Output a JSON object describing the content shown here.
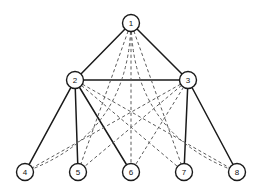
{
  "figure": {
    "background_color": "#ffffff",
    "solid_edge_color": "#1a1a1a",
    "dashed_edge_color": "#5a5a5a",
    "node_fill_color": "#ffffff",
    "node_stroke_color": "#1a1a1a"
  },
  "chart_data": {
    "type": "diagram",
    "subtype": "node-link-graph",
    "title": "",
    "xlabel": "",
    "ylabel": "",
    "grid": false,
    "legend": [],
    "node_radius": 8.5,
    "nodes": [
      {
        "id": "1",
        "label": "1",
        "x": 131,
        "y": 23
      },
      {
        "id": "2",
        "label": "2",
        "x": 75,
        "y": 80
      },
      {
        "id": "3",
        "label": "3",
        "x": 188,
        "y": 80
      },
      {
        "id": "4",
        "label": "4",
        "x": 25,
        "y": 172
      },
      {
        "id": "5",
        "label": "5",
        "x": 78,
        "y": 172
      },
      {
        "id": "6",
        "label": "6",
        "x": 131,
        "y": 172
      },
      {
        "id": "7",
        "label": "7",
        "x": 184,
        "y": 172
      },
      {
        "id": "8",
        "label": "8",
        "x": 237,
        "y": 172
      }
    ],
    "edges": [
      {
        "from": "1",
        "to": "2",
        "style": "solid",
        "shape": "line"
      },
      {
        "from": "1",
        "to": "3",
        "style": "solid",
        "shape": "line"
      },
      {
        "from": "2",
        "to": "3",
        "style": "solid",
        "shape": "line"
      },
      {
        "from": "2",
        "to": "4",
        "style": "solid",
        "shape": "line"
      },
      {
        "from": "2",
        "to": "5",
        "style": "solid",
        "shape": "line"
      },
      {
        "from": "2",
        "to": "6",
        "style": "solid",
        "shape": "line"
      },
      {
        "from": "3",
        "to": "6",
        "style": "dashed",
        "shape": "line"
      },
      {
        "from": "3",
        "to": "7",
        "style": "solid",
        "shape": "line"
      },
      {
        "from": "3",
        "to": "8",
        "style": "solid",
        "shape": "line"
      },
      {
        "from": "1",
        "to": "5",
        "style": "dashed",
        "shape": "line"
      },
      {
        "from": "1",
        "to": "6",
        "style": "dashed",
        "shape": "line"
      },
      {
        "from": "1",
        "to": "7",
        "style": "dashed",
        "shape": "line"
      },
      {
        "from": "1",
        "to": "4",
        "style": "dashed",
        "shape": "arc",
        "curve": -58
      },
      {
        "from": "1",
        "to": "8",
        "style": "dashed",
        "shape": "arc",
        "curve": 58
      },
      {
        "from": "2",
        "to": "7",
        "style": "dashed",
        "shape": "line"
      },
      {
        "from": "2",
        "to": "8",
        "style": "dashed",
        "shape": "line"
      },
      {
        "from": "3",
        "to": "4",
        "style": "dashed",
        "shape": "line"
      },
      {
        "from": "3",
        "to": "5",
        "style": "dashed",
        "shape": "line"
      },
      {
        "from": "4",
        "to": "5",
        "style": "none",
        "shape": "line"
      }
    ]
  }
}
